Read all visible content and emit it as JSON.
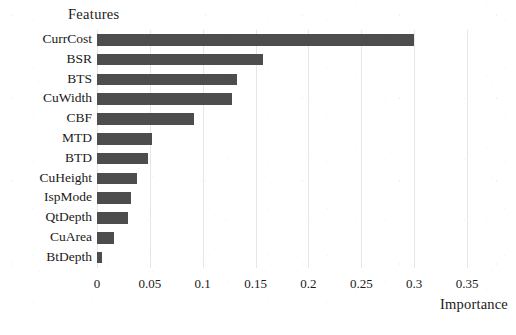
{
  "chart_data": {
    "type": "bar",
    "orientation": "horizontal",
    "title": "Features",
    "xlabel": "Importance",
    "ylabel": "Features",
    "categories": [
      "CurrCost",
      "BSR",
      "BTS",
      "CuWidth",
      "CBF",
      "MTD",
      "BTD",
      "CuHeight",
      "IspMode",
      "QtDepth",
      "CuArea",
      "BtDepth"
    ],
    "values": [
      0.3,
      0.157,
      0.132,
      0.128,
      0.092,
      0.052,
      0.048,
      0.038,
      0.032,
      0.029,
      0.016,
      0.005
    ],
    "xlim": [
      0,
      0.35
    ],
    "xticks": [
      0,
      0.05,
      0.1,
      0.15,
      0.2,
      0.25,
      0.3,
      0.35
    ],
    "xtick_labels": [
      "0",
      "0.05",
      "0.1",
      "0.15",
      "0.2",
      "0.25",
      "0.3",
      "0.35"
    ],
    "grid": "vertical",
    "legend": "none",
    "bar_color": "#4d4d4d",
    "grid_color": "#e6e6e6",
    "background_color": "#ffffff"
  }
}
